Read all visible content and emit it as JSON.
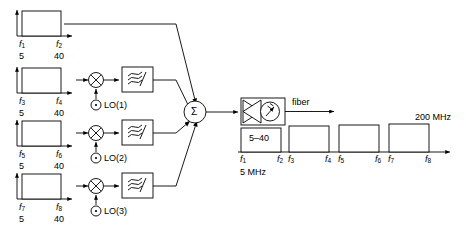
{
  "figure": {
    "type": "block-diagram"
  },
  "input_channels": [
    {
      "id": "ch1",
      "f_low_label": "f",
      "f_low_sub": "1",
      "f_high_label": "f",
      "f_high_sub": "2",
      "low_value": "5",
      "high_value": "40",
      "has_mixer": false,
      "lo_label": null
    },
    {
      "id": "ch2",
      "f_low_label": "f",
      "f_low_sub": "3",
      "f_high_label": "f",
      "f_high_sub": "4",
      "low_value": "5",
      "high_value": "40",
      "has_mixer": true,
      "lo_label": "LO(1)"
    },
    {
      "id": "ch3",
      "f_low_label": "f",
      "f_low_sub": "5",
      "f_high_label": "f",
      "f_high_sub": "6",
      "low_value": "5",
      "high_value": "40",
      "has_mixer": true,
      "lo_label": "LO(2)"
    },
    {
      "id": "ch4",
      "f_low_label": "f",
      "f_low_sub": "7",
      "f_high_label": "f",
      "f_high_sub": "8",
      "low_value": "5",
      "high_value": "40",
      "has_mixer": true,
      "lo_label": "LO(3)"
    }
  ],
  "summer": {
    "symbol": "Σ"
  },
  "transmitter": {
    "icon": "laser-diode-icon",
    "output_label": "fiber"
  },
  "output_spectrum": {
    "first_band_label": "5–40",
    "start_label": "5 MHz",
    "end_label": "200 MHz",
    "ticks": [
      {
        "label": "f",
        "sub": "1"
      },
      {
        "label": "f",
        "sub": "2"
      },
      {
        "label": "f",
        "sub": "3"
      },
      {
        "label": "f",
        "sub": "4"
      },
      {
        "label": "f",
        "sub": "5"
      },
      {
        "label": "f",
        "sub": "6"
      },
      {
        "label": "f",
        "sub": "7"
      },
      {
        "label": "f",
        "sub": "8"
      }
    ]
  },
  "colors": {
    "line": "#000000",
    "background": "#ffffff",
    "fill": "#ffffff"
  }
}
